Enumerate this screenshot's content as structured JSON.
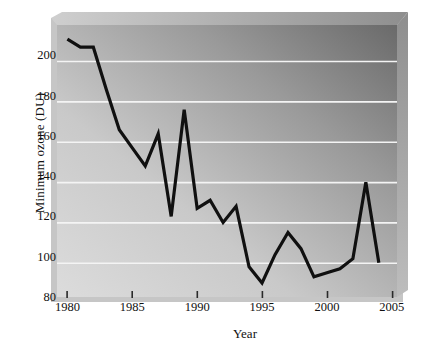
{
  "chart_data": {
    "type": "line",
    "title": "",
    "xlabel": "Year",
    "ylabel": "Minimum ozone (DU)",
    "xlim": [
      1979.2,
      2005.4
    ],
    "ylim": [
      80,
      215
    ],
    "xticks": [
      1980,
      1985,
      1990,
      1995,
      2000,
      2005
    ],
    "xticklabels": [
      "1980",
      "1985",
      "1990",
      "1995",
      "2000",
      "2005"
    ],
    "yticks": [
      80,
      100,
      120,
      140,
      160,
      180,
      200
    ],
    "yticklabels": [
      "80",
      "100",
      "120",
      "140",
      "160",
      "180",
      "200"
    ],
    "gridlines": {
      "horizontal": true,
      "vertical": false,
      "color": "#f2f2f2"
    },
    "legend": null,
    "series": [
      {
        "name": "Minimum ozone",
        "color": "#101010",
        "linewidth": 3.2,
        "x": [
          1980,
          1981,
          1982,
          1983,
          1984,
          1985,
          1986,
          1987,
          1988,
          1989,
          1990,
          1991,
          1992,
          1993,
          1994,
          1995,
          1996,
          1997,
          1998,
          1999,
          2000,
          2001,
          2002,
          2003,
          2004
        ],
        "values": [
          208,
          204,
          204,
          183,
          163,
          154,
          145,
          161,
          120,
          173,
          124,
          128,
          117,
          125,
          95,
          87,
          101,
          112,
          104,
          90,
          92,
          94,
          99,
          137,
          97
        ]
      }
    ]
  },
  "axes": {
    "y_title": "Minimum ozone (DU)",
    "x_title": "Year"
  },
  "style": {
    "plot_bg_light": "#d8d8d8",
    "plot_bg_dark": "#6e6e6e",
    "grid_color": "#f4f4f4",
    "line_color": "#101010",
    "text_color": "#111111",
    "shadow_color": "#b9b9b9"
  }
}
